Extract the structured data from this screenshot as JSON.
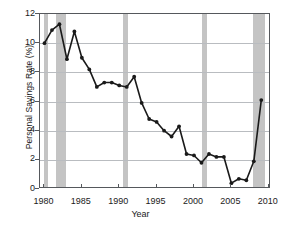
{
  "chart_data": {
    "type": "line",
    "title": "",
    "subtitle": "",
    "xlabel": "Year",
    "ylabel": "Personal Savings Rate (%)",
    "xlim": [
      1979.4,
      2010.3
    ],
    "ylim": [
      0,
      12
    ],
    "xticks": [
      1980,
      1985,
      1990,
      1995,
      2000,
      2005,
      2010
    ],
    "xtick_labels": [
      "1980",
      "1985",
      "1990",
      "1995",
      "2000",
      "2005",
      "2010"
    ],
    "yticks": [
      0,
      2,
      4,
      6,
      8,
      10,
      12
    ],
    "ytick_labels": [
      "0",
      "2",
      "4",
      "6",
      "8",
      "10",
      "12"
    ],
    "grid": "horizontal",
    "legend": "none",
    "marker": "filled-circle",
    "line_color": "#1a1a1a",
    "marker_color": "#1a1a1a",
    "grid_color": "#b9bcc0",
    "axis_color": "#55585c",
    "band_color": "#c4c4c4",
    "background": "#ffffff",
    "series": [
      {
        "name": "Personal Savings Rate",
        "x": [
          1980,
          1981,
          1982,
          1983,
          1984,
          1985,
          1986,
          1987,
          1988,
          1989,
          1990,
          1991,
          1992,
          1993,
          1994,
          1995,
          1996,
          1997,
          1998,
          1999,
          2000,
          2001,
          2002,
          2003,
          2004,
          2005,
          2006,
          2007,
          2008,
          2009
        ],
        "values": [
          10.0,
          10.9,
          11.3,
          8.9,
          10.8,
          9.0,
          8.2,
          7.0,
          7.3,
          7.3,
          7.1,
          7.0,
          7.7,
          5.9,
          4.8,
          4.6,
          4.0,
          3.6,
          4.3,
          2.4,
          2.3,
          1.8,
          2.4,
          2.2,
          2.2,
          0.4,
          0.7,
          0.6,
          1.9,
          6.1
        ]
      }
    ],
    "recession_bands": [
      {
        "start": 1980.0,
        "end": 1980.5,
        "label": "recession-1980"
      },
      {
        "start": 1981.5,
        "end": 1982.9,
        "label": "recession-1981-1982"
      },
      {
        "start": 1990.5,
        "end": 1991.2,
        "label": "recession-1990-1991"
      },
      {
        "start": 2001.1,
        "end": 2001.8,
        "label": "recession-2001"
      },
      {
        "start": 2007.9,
        "end": 2009.5,
        "label": "recession-2007-2009"
      }
    ]
  }
}
